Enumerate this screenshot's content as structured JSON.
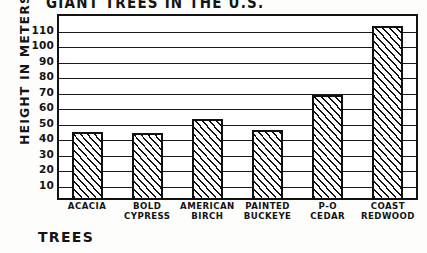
{
  "chart_data": {
    "type": "bar",
    "title": "GIANT TREES IN THE U.S.",
    "xlabel": "TREES",
    "ylabel": "HEIGHT IN METERS",
    "categories": [
      "ACACIA",
      "BOLD CYPRESS",
      "AMERICAN BIRCH",
      "PAINTED BUCKEYE",
      "P-O CEDAR",
      "COAST REDWOOD"
    ],
    "values": [
      44,
      43,
      52,
      45,
      68,
      112
    ],
    "ylim": [
      0,
      120
    ],
    "yticks": [
      10,
      20,
      30,
      40,
      50,
      60,
      70,
      80,
      90,
      100,
      110
    ],
    "ytick_labels": [
      "10",
      "20",
      "30",
      "40",
      "50",
      "60",
      "70",
      "80",
      "90",
      "100",
      "110"
    ],
    "grid": true,
    "legend": false,
    "style": "hand-drawn, hatched bars"
  },
  "axes": {
    "y_tick_values": [
      110,
      100,
      90,
      80,
      70,
      60,
      50,
      40,
      30,
      20,
      10
    ],
    "y_max_display": 120
  },
  "bars": [
    {
      "label_lines": [
        "ACACIA"
      ],
      "value": 44
    },
    {
      "label_lines": [
        "BOLD",
        "CYPRESS"
      ],
      "value": 43
    },
    {
      "label_lines": [
        "AMERICAN",
        "BIRCH"
      ],
      "value": 52
    },
    {
      "label_lines": [
        "PAINTED",
        "BUCKEYE"
      ],
      "value": 45
    },
    {
      "label_lines": [
        "P-O",
        "CEDAR"
      ],
      "value": 68
    },
    {
      "label_lines": [
        "COAST",
        "REDWOOD"
      ],
      "value": 112
    }
  ],
  "colors": {
    "ink": "#121212",
    "paper": "#ffffff",
    "hatch": "#101010"
  }
}
